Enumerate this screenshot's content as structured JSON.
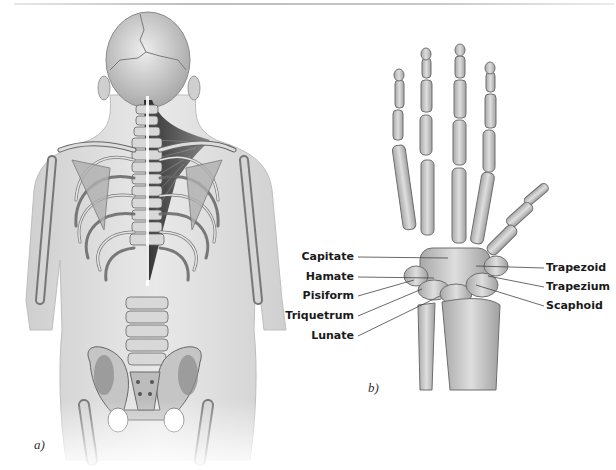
{
  "figure": {
    "panels": [
      {
        "id": "a",
        "label": "a)",
        "subject": "posterior-torso-skeleton-with-trapezius-highlight"
      },
      {
        "id": "b",
        "label": "b)",
        "subject": "hand-and-wrist-skeleton",
        "labels_left": [
          "Capitate",
          "Hamate",
          "Pisiform",
          "Triquetrum",
          "Lunate"
        ],
        "labels_right": [
          "Trapezoid",
          "Trapezium",
          "Scaphoid"
        ]
      }
    ]
  },
  "colors": {
    "background": "#ffffff",
    "bone_fill": "#cfcfcf",
    "bone_stroke": "#6e6e6e",
    "skin_fill": "#e2e2e2",
    "muscle_dark": "#2b2b2b",
    "label_text": "#1a1a1a",
    "leader_line": "#444444"
  }
}
